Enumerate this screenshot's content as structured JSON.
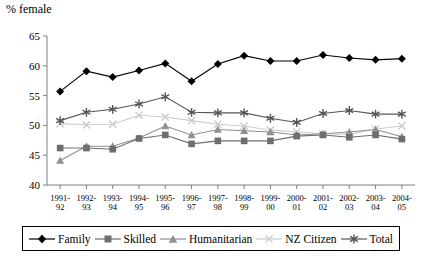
{
  "chart_data": {
    "type": "line",
    "title": "",
    "ylabel": "% female",
    "xlabel": "",
    "ylim": [
      40,
      65
    ],
    "yticks": [
      40,
      45,
      50,
      55,
      60,
      65
    ],
    "grid": false,
    "legend_position": "bottom",
    "categories": [
      "1991-\n92",
      "1992-\n93",
      "1993-\n94",
      "1994-\n95",
      "1995-\n96",
      "1996-\n97",
      "1997-\n98",
      "1998-\n99",
      "1999-\n00",
      "2000-\n01",
      "2001-\n02",
      "2002-\n03",
      "2003-\n04",
      "2004-\n05"
    ],
    "categories_line1": [
      "1991-",
      "1992-",
      "1993-",
      "1994-",
      "1995-",
      "1996-",
      "1997-",
      "1998-",
      "1999-",
      "2000-",
      "2001-",
      "2002-",
      "2003-",
      "2004-"
    ],
    "categories_line2": [
      "92",
      "93",
      "94",
      "95",
      "96",
      "97",
      "98",
      "99",
      "00",
      "01",
      "02",
      "03",
      "04",
      "05"
    ],
    "series": [
      {
        "name": "Family",
        "marker": "diamond",
        "color": "#000000",
        "values": [
          55.7,
          59.1,
          58.1,
          59.2,
          60.4,
          57.4,
          60.3,
          61.7,
          60.8,
          60.8,
          61.8,
          61.3,
          61.0,
          61.2
        ]
      },
      {
        "name": "Skilled",
        "marker": "square",
        "color": "#6e6e6e",
        "values": [
          46.2,
          46.2,
          46.0,
          47.8,
          48.4,
          46.9,
          47.4,
          47.4,
          47.4,
          48.2,
          48.4,
          48.0,
          48.4,
          47.7
        ]
      },
      {
        "name": "Humanitarian",
        "marker": "triangle",
        "color": "#909090",
        "values": [
          44.1,
          46.5,
          46.5,
          47.9,
          49.9,
          48.4,
          49.3,
          49.1,
          48.9,
          48.4,
          48.6,
          48.9,
          49.3,
          48.1
        ]
      },
      {
        "name": "NZ Citizen",
        "marker": "cross",
        "color": "#cccccc",
        "values": [
          50.3,
          50.1,
          50.2,
          51.7,
          51.4,
          50.8,
          50.2,
          49.9,
          49.2,
          48.9,
          48.6,
          48.5,
          49.4,
          49.9
        ]
      },
      {
        "name": "Total",
        "marker": "asterisk",
        "color": "#555555",
        "values": [
          50.8,
          52.2,
          52.7,
          53.6,
          54.8,
          52.2,
          52.1,
          52.1,
          51.2,
          50.5,
          52.0,
          52.5,
          51.9,
          51.9
        ]
      }
    ]
  },
  "legend": {
    "items": [
      {
        "label": "Family"
      },
      {
        "label": "Skilled"
      },
      {
        "label": "Humanitarian"
      },
      {
        "label": "NZ Citizen"
      },
      {
        "label": "Total"
      }
    ]
  }
}
